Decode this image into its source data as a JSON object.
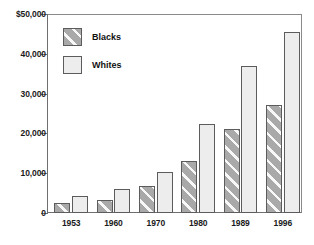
{
  "chart_data": {
    "type": "bar",
    "title": "",
    "subtitle": "",
    "xlabel": "",
    "ylabel": "",
    "categories": [
      "1953",
      "1960",
      "1970",
      "1980",
      "1989",
      "1996"
    ],
    "series": [
      {
        "name": "Blacks",
        "values": [
          2500,
          3300,
          6800,
          13000,
          21000,
          27200
        ]
      },
      {
        "name": "Whites",
        "values": [
          4300,
          6000,
          10300,
          22400,
          36900,
          45600
        ]
      }
    ],
    "ylim": [
      0,
      50000
    ],
    "ytick_values": [
      0,
      10000,
      20000,
      30000,
      40000,
      50000
    ],
    "ytick_labels": [
      "0",
      "10,000",
      "20,000",
      "30,000",
      "40,000",
      "$50,000"
    ],
    "grid": false,
    "legend_position": "top-left",
    "legend_entries": [
      "Blacks",
      "Whites"
    ],
    "annotations": []
  },
  "legend": {
    "items": [
      {
        "label": "Blacks",
        "swatch": "hatched-gray-swatch",
        "color": "#a9a9a9"
      },
      {
        "label": "Whites",
        "swatch": "light-gray-swatch",
        "color": "#ededed"
      }
    ]
  },
  "colors": {
    "blacks_fill": "#a9a9a9",
    "whites_fill": "#ededed",
    "bar_outline": "#5c5c5c",
    "axis": "#6f6f6f",
    "text": "#1a1a1a",
    "background": "#ffffff"
  }
}
